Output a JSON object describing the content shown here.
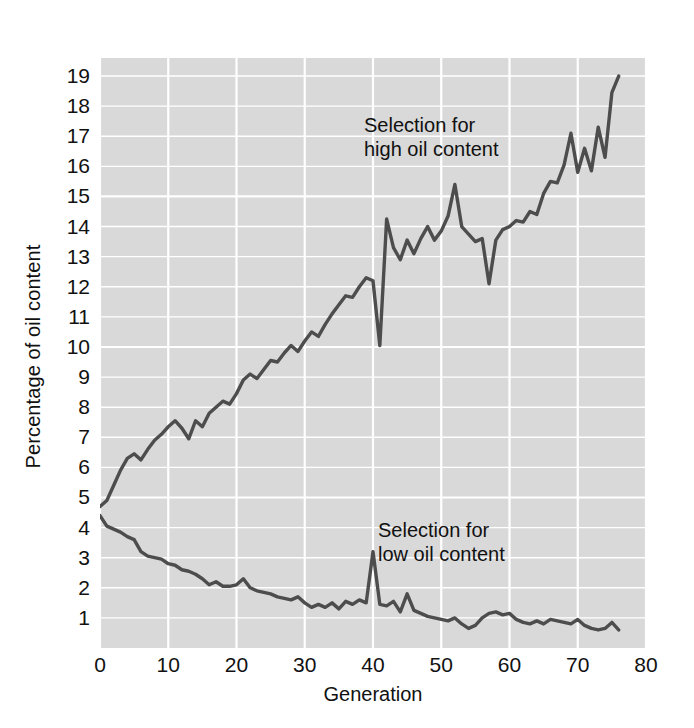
{
  "chart_data": {
    "type": "line",
    "title": "",
    "xlabel": "Generation",
    "ylabel": "Percentage of oil content",
    "xlim": [
      0,
      80
    ],
    "ylim": [
      0,
      19.6
    ],
    "xticks": [
      0,
      10,
      20,
      30,
      40,
      50,
      60,
      70,
      80
    ],
    "yticks": [
      1,
      2,
      3,
      4,
      5,
      6,
      7,
      8,
      9,
      10,
      11,
      12,
      13,
      14,
      15,
      16,
      17,
      18,
      19
    ],
    "grid": true,
    "legend_position": "none",
    "plot_background": "#d9d9d9",
    "gridline_color": "#ffffff",
    "line_color": "#4d4d4d",
    "annotations": [
      {
        "id": "high",
        "text": "Selection for\nhigh oil content",
        "x": 40,
        "y": 17.2
      },
      {
        "id": "low",
        "text": "Selection for\nlow oil content",
        "x": 42,
        "y": 4.3
      }
    ],
    "series": [
      {
        "name": "Selection for high oil content",
        "x": [
          0,
          1,
          2,
          3,
          4,
          5,
          6,
          7,
          8,
          9,
          10,
          11,
          12,
          13,
          14,
          15,
          16,
          17,
          18,
          19,
          20,
          21,
          22,
          23,
          24,
          25,
          26,
          27,
          28,
          29,
          30,
          31,
          32,
          33,
          34,
          35,
          36,
          37,
          38,
          39,
          40,
          41,
          42,
          43,
          44,
          45,
          46,
          47,
          48,
          49,
          50,
          51,
          52,
          53,
          54,
          55,
          56,
          57,
          58,
          59,
          60,
          61,
          62,
          63,
          64,
          65,
          66,
          67,
          68,
          69,
          70,
          71,
          72,
          73,
          74,
          75,
          76
        ],
        "values": [
          4.7,
          4.9,
          5.4,
          5.9,
          6.3,
          6.45,
          6.25,
          6.6,
          6.9,
          7.1,
          7.35,
          7.55,
          7.3,
          6.95,
          7.55,
          7.35,
          7.8,
          8.0,
          8.2,
          8.1,
          8.45,
          8.9,
          9.1,
          8.95,
          9.25,
          9.55,
          9.5,
          9.8,
          10.05,
          9.85,
          10.2,
          10.5,
          10.35,
          10.75,
          11.1,
          11.4,
          11.7,
          11.65,
          12.0,
          12.3,
          12.2,
          10.05,
          14.25,
          13.3,
          12.9,
          13.55,
          13.1,
          13.6,
          14.0,
          13.55,
          13.85,
          14.35,
          15.4,
          14.0,
          13.75,
          13.5,
          13.6,
          12.1,
          13.55,
          13.9,
          14.0,
          14.2,
          14.15,
          14.5,
          14.4,
          15.1,
          15.5,
          15.45,
          16.05,
          17.1,
          15.8,
          16.6,
          15.85,
          17.3,
          16.3,
          18.45,
          19.0
        ]
      },
      {
        "name": "Selection for low oil content",
        "x": [
          0,
          1,
          2,
          3,
          4,
          5,
          6,
          7,
          8,
          9,
          10,
          11,
          12,
          13,
          14,
          15,
          16,
          17,
          18,
          19,
          20,
          21,
          22,
          23,
          24,
          25,
          26,
          27,
          28,
          29,
          30,
          31,
          32,
          33,
          34,
          35,
          36,
          37,
          38,
          39,
          40,
          41,
          42,
          43,
          44,
          45,
          46,
          47,
          48,
          49,
          50,
          51,
          52,
          53,
          54,
          55,
          56,
          57,
          58,
          59,
          60,
          61,
          62,
          63,
          64,
          65,
          66,
          67,
          68,
          69,
          70,
          71,
          72,
          73,
          74,
          75,
          76
        ],
        "values": [
          4.4,
          4.05,
          3.95,
          3.85,
          3.7,
          3.6,
          3.2,
          3.05,
          3.0,
          2.95,
          2.8,
          2.75,
          2.6,
          2.55,
          2.45,
          2.3,
          2.1,
          2.2,
          2.05,
          2.05,
          2.1,
          2.3,
          2.0,
          1.9,
          1.85,
          1.8,
          1.7,
          1.65,
          1.6,
          1.7,
          1.5,
          1.35,
          1.45,
          1.35,
          1.5,
          1.3,
          1.55,
          1.45,
          1.6,
          1.5,
          3.2,
          1.45,
          1.4,
          1.55,
          1.2,
          1.8,
          1.25,
          1.15,
          1.05,
          1.0,
          0.95,
          0.9,
          1.0,
          0.8,
          0.65,
          0.75,
          1.0,
          1.15,
          1.2,
          1.1,
          1.15,
          0.95,
          0.85,
          0.8,
          0.9,
          0.8,
          0.95,
          0.9,
          0.85,
          0.8,
          0.95,
          0.75,
          0.65,
          0.6,
          0.65,
          0.85,
          0.6
        ]
      }
    ]
  },
  "axes": {
    "y_title": "Percentage of oil content",
    "x_title": "Generation",
    "y_tick_labels": [
      "19",
      "18",
      "17",
      "16",
      "15",
      "14",
      "13",
      "12",
      "11",
      "10",
      "9",
      "8",
      "7",
      "6",
      "5",
      "4",
      "3",
      "2",
      "1"
    ],
    "x_tick_labels": [
      "0",
      "10",
      "20",
      "30",
      "40",
      "50",
      "60",
      "70",
      "80"
    ]
  },
  "annotations": {
    "high_line1": "Selection for",
    "high_line2": "high oil content",
    "low_line1": "Selection for",
    "low_line2": "low oil content"
  }
}
